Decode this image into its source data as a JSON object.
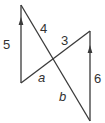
{
  "diagram": {
    "type": "geometry",
    "colors": {
      "line": "#3a3a3a",
      "text": "#333333",
      "background": "#ffffff"
    },
    "labels": {
      "left_vertical": "5",
      "upper_left_segment": "4",
      "upper_right_segment": "3",
      "right_vertical": "6",
      "angle_a": "a",
      "angle_b": "b"
    }
  }
}
